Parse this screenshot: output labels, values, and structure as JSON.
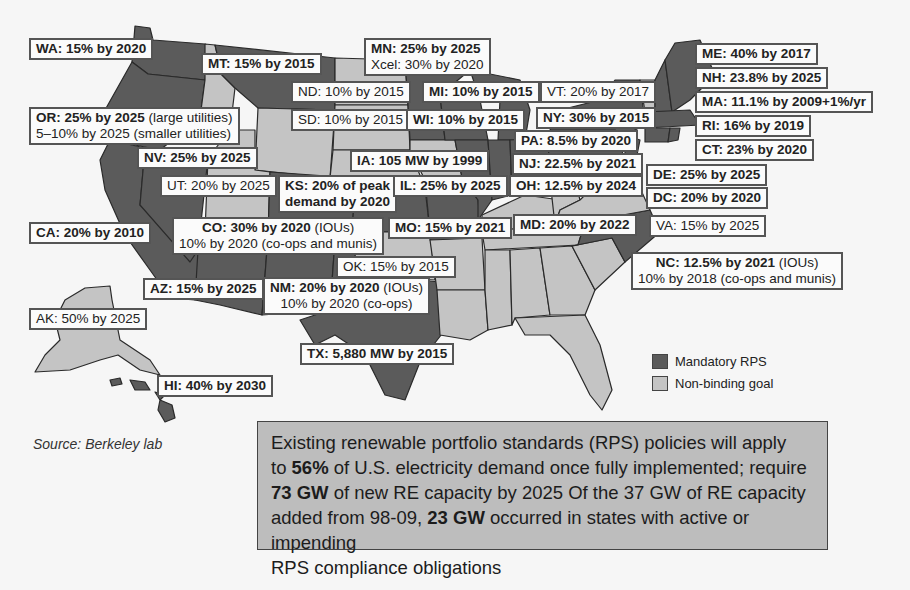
{
  "colors": {
    "mandatory": "#5b5b5b",
    "non_binding": "#c4c4c4",
    "no_policy": "#f3f3f3",
    "callout_bg": "#bdbdbd",
    "border": "#2a2a2a"
  },
  "legend": {
    "mandatory_label": "Mandatory RPS",
    "non_binding_label": "Non-binding goal"
  },
  "source": "Source: Berkeley lab",
  "states": {
    "WA": {
      "bold": "WA: 15% by 2020"
    },
    "MT": {
      "bold": "MT: 15% by 2015"
    },
    "MN": {
      "bold": "MN: 25% by 2025",
      "line2": "Xcel: 30% by 2020"
    },
    "ND": {
      "normal": "ND: 10% by 2015"
    },
    "MI": {
      "bold": "MI: 10% by 2015"
    },
    "VT": {
      "normal": "VT: 20% by 2017"
    },
    "ME": {
      "bold": "ME: 40% by 2017"
    },
    "NH": {
      "bold": "NH: 23.8% by 2025"
    },
    "MA": {
      "bold": "MA: 11.1% by 2009+1%/yr"
    },
    "OR": {
      "bold": "OR: 25% by 2025",
      "bold_suffix": " (large utilities)",
      "line2": "5–10% by 2025 (smaller utilities)"
    },
    "SD": {
      "normal": "SD: 10% by 2015"
    },
    "WI": {
      "bold": "WI: 10% by 2015"
    },
    "NY": {
      "bold": "NY: 30% by 2015"
    },
    "RI": {
      "bold": "RI: 16% by 2019"
    },
    "PA": {
      "bold": "PA: 8.5% by 2020"
    },
    "CT": {
      "bold": "CT: 23% by 2020"
    },
    "NV": {
      "bold": "NV: 25% by 2025"
    },
    "IA": {
      "bold": "IA: 105 MW by 1999"
    },
    "NJ": {
      "bold": "NJ: 22.5% by 2021"
    },
    "DE": {
      "bold": "DE: 25% by 2025"
    },
    "UT": {
      "normal": "UT: 20% by 2025"
    },
    "KS": {
      "bold": "KS: 20% of peak",
      "line2": "demand by 2020"
    },
    "IL": {
      "bold": "IL: 25% by 2025"
    },
    "OH": {
      "bold": "OH: 12.5% by 2024"
    },
    "DC": {
      "bold": "DC: 20% by 2020"
    },
    "CA": {
      "bold": "CA: 20% by 2010"
    },
    "CO": {
      "bold": "CO: 30% by 2020",
      "suffix": " (IOUs)",
      "line2": "10% by 2020 (co-ops and munis)"
    },
    "MO": {
      "bold": "MO: 15% by 2021"
    },
    "MD": {
      "bold": "MD: 20% by 2022"
    },
    "VA": {
      "normal": "VA: 15% by 2025"
    },
    "OK": {
      "normal": "OK: 15% by 2015"
    },
    "NC": {
      "bold": "NC: 12.5% by 2021",
      "suffix": " (IOUs)",
      "line2": "10% by 2018 (co-ops and munis)"
    },
    "AZ": {
      "bold": "AZ: 15% by 2025"
    },
    "NM": {
      "bold": "NM: 20% by 2020",
      "suffix": " (IOUs)",
      "line2": "10% by 2020 (co-ops)"
    },
    "AK": {
      "normal": "AK: 50% by 2025"
    },
    "TX": {
      "bold": "TX: 5,880 MW by 2015"
    },
    "HI": {
      "bold": "HI: 40% by 2030"
    }
  },
  "callout": {
    "l1": "Existing renewable portfolio standards (RPS) policies will apply",
    "l2a": "to ",
    "l2b": "56%",
    "l2c": " of U.S. electricity demand once fully implemented; require",
    "l3a": "73 GW",
    "l3b": " of new RE capacity by 2025 Of the 37 GW of RE capacity",
    "l4a": "added from 98-09, ",
    "l4b": "23 GW",
    "l4c": " occurred in states with active or impending",
    "l5": "RPS compliance obligations"
  }
}
